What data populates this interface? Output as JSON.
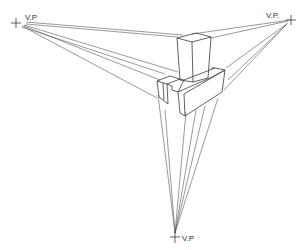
{
  "diagram": {
    "vanishing_points": [
      {
        "id": "left",
        "label": "V.P",
        "x": 16,
        "y": 23
      },
      {
        "id": "right",
        "label": "V.P.",
        "x": 291,
        "y": 20
      },
      {
        "id": "bottom",
        "label": "V.P",
        "x": 175,
        "y": 237
      }
    ],
    "stroke_color": "#3a3a3a",
    "background": "#ffffff"
  }
}
